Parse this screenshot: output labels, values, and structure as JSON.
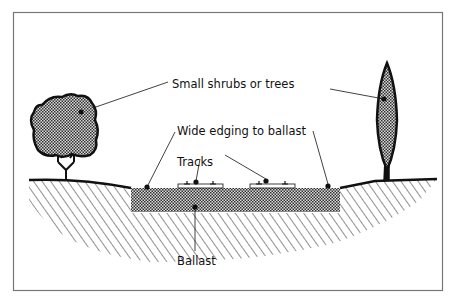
{
  "figure": {
    "labels": {
      "shrubs": "Small shrubs or trees",
      "edging": "Wide edging to ballast",
      "tracks": "Tracks",
      "ballast": "Ballast"
    },
    "elements": [
      {
        "name": "bushy-tree",
        "side": "left"
      },
      {
        "name": "columnar-tree",
        "side": "right"
      },
      {
        "name": "ground-profile",
        "pattern": "diagonal-hatch"
      },
      {
        "name": "ballast-bed",
        "pattern": "crosshatch"
      },
      {
        "name": "track-left",
        "type": "sleeper-with-rails"
      },
      {
        "name": "track-right",
        "type": "sleeper-with-rails"
      }
    ],
    "colors": {
      "line": "#111111",
      "foliage_fill": "#8a8a8a",
      "ballast_fill": "#9a9a9a",
      "frame": "#777777",
      "background": "#ffffff"
    }
  }
}
